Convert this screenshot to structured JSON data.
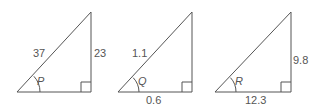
{
  "diagram": {
    "triangles": [
      {
        "angle_label": "P",
        "hypotenuse": "37",
        "opposite": "23",
        "adjacent": "",
        "geom": {
          "x0": 17,
          "x1": 91,
          "ytop": 12,
          "ybase": 92
        }
      },
      {
        "angle_label": "Q",
        "hypotenuse": "1.1",
        "opposite": "",
        "adjacent": "0.6",
        "geom": {
          "x0": 118,
          "x1": 192,
          "ytop": 12,
          "ybase": 92
        }
      },
      {
        "angle_label": "R",
        "hypotenuse": "",
        "opposite": "9.8",
        "adjacent": "12.3",
        "geom": {
          "x0": 215,
          "x1": 291,
          "ytop": 12,
          "ybase": 92
        }
      }
    ],
    "colors": {
      "line": "#555555",
      "text": "#555555",
      "background": "#ffffff"
    }
  }
}
